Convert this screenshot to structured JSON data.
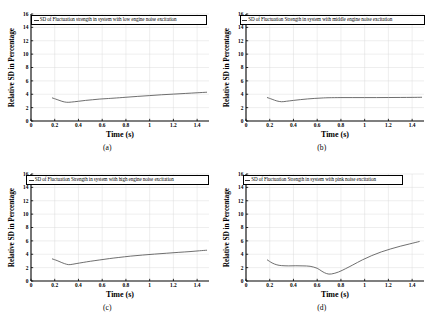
{
  "figure": {
    "panels": [
      {
        "caption": "(a)",
        "legend_label": "SD of Fluctuation strength in system with low engine noise excitation",
        "legend_left": 31,
        "legend_width": 176
      },
      {
        "caption": "(b)",
        "legend_label": "SD of Fluctuation Strength in system with middle engine noise excitation",
        "legend_left": 25,
        "legend_width": 185
      },
      {
        "caption": "(c)",
        "legend_label": "SD of Fluctuation Strength in system with high engine noise excitation",
        "legend_left": 26,
        "legend_width": 183
      },
      {
        "caption": "(d)",
        "legend_label": "SD of Fluctuation Strength in system with pink noise excitation",
        "legend_left": 28,
        "legend_width": 160
      }
    ]
  },
  "chart_data": [
    {
      "type": "line",
      "title": "",
      "panel": "(a)",
      "legend": [
        "SD of Fluctuation strength in system with low engine noise excitation"
      ],
      "legend_position": "top-inside",
      "grid": true,
      "xlabel": "Time (s)",
      "ylabel": "Relative SD in Percentage",
      "xlim": [
        0,
        1.5
      ],
      "ylim": [
        0,
        16
      ],
      "xticks": [
        0,
        0.2,
        0.4,
        0.6,
        0.8,
        1,
        1.2,
        1.4
      ],
      "xticklabels": [
        "0",
        "0.2",
        "0.4",
        "0.6",
        "0.8",
        "1",
        "1.2",
        "1.4"
      ],
      "yticks": [
        0,
        2,
        4,
        6,
        8,
        10,
        12,
        14,
        16
      ],
      "yticklabels": [
        "0",
        "2",
        "4",
        "6",
        "8",
        "10",
        "12",
        "14",
        "16"
      ],
      "series": [
        {
          "name": "SD of Fluctuation strength in system with low engine noise excitation",
          "color": "#555555",
          "x": [
            0.18,
            0.22,
            0.26,
            0.3,
            0.34,
            0.4,
            0.46,
            0.52,
            0.58,
            0.64,
            0.7,
            0.8,
            0.9,
            1.0,
            1.1,
            1.2,
            1.3,
            1.4,
            1.48
          ],
          "y": [
            3.45,
            3.2,
            2.95,
            2.8,
            2.83,
            2.95,
            3.08,
            3.18,
            3.28,
            3.35,
            3.42,
            3.55,
            3.68,
            3.8,
            3.92,
            4.02,
            4.12,
            4.22,
            4.3
          ]
        }
      ]
    },
    {
      "type": "line",
      "title": "",
      "panel": "(b)",
      "legend": [
        "SD of Fluctuation Strength in system with middle engine noise excitation"
      ],
      "legend_position": "top-inside",
      "grid": true,
      "xlabel": "Time (s)",
      "ylabel": "Relative SD in Percentage",
      "xlim": [
        0,
        1.5
      ],
      "ylim": [
        0,
        16
      ],
      "xticks": [
        0,
        0.2,
        0.4,
        0.6,
        0.8,
        1,
        1.2,
        1.4
      ],
      "xticklabels": [
        "0",
        "0.2",
        "0.4",
        "0.6",
        "0.8",
        "1",
        "1.2",
        "1.4"
      ],
      "yticks": [
        0,
        2,
        4,
        6,
        8,
        10,
        12,
        14,
        16
      ],
      "yticklabels": [
        "0",
        "2",
        "4",
        "6",
        "8",
        "10",
        "12",
        "14",
        "16"
      ],
      "series": [
        {
          "name": "SD of Fluctuation Strength in system with middle engine noise excitation",
          "color": "#555555",
          "x": [
            0.18,
            0.22,
            0.26,
            0.3,
            0.34,
            0.4,
            0.46,
            0.52,
            0.58,
            0.64,
            0.7,
            0.8,
            0.9,
            1.0,
            1.1,
            1.2,
            1.3,
            1.4,
            1.48
          ],
          "y": [
            3.5,
            3.25,
            3.0,
            2.88,
            2.95,
            3.08,
            3.2,
            3.3,
            3.38,
            3.44,
            3.48,
            3.5,
            3.5,
            3.5,
            3.5,
            3.51,
            3.52,
            3.53,
            3.55
          ]
        }
      ]
    },
    {
      "type": "line",
      "title": "",
      "panel": "(c)",
      "legend": [
        "SD of Fluctuation Strength in system with high engine noise excitation"
      ],
      "legend_position": "top-inside",
      "grid": true,
      "xlabel": "Time (s)",
      "ylabel": "Relative SD in Percentage",
      "xlim": [
        0,
        1.5
      ],
      "ylim": [
        0,
        16
      ],
      "xticks": [
        0,
        0.2,
        0.4,
        0.6,
        0.8,
        1,
        1.2,
        1.4
      ],
      "xticklabels": [
        "0",
        "0.2",
        "0.4",
        "0.6",
        "0.8",
        "1",
        "1.2",
        "1.4"
      ],
      "yticks": [
        0,
        2,
        4,
        6,
        8,
        10,
        12,
        14,
        16
      ],
      "yticklabels": [
        "0",
        "2",
        "4",
        "6",
        "8",
        "10",
        "12",
        "14",
        "16"
      ],
      "series": [
        {
          "name": "SD of Fluctuation Strength in system with high engine noise excitation",
          "color": "#555555",
          "x": [
            0.18,
            0.22,
            0.26,
            0.3,
            0.33,
            0.38,
            0.44,
            0.5,
            0.58,
            0.66,
            0.74,
            0.84,
            0.94,
            1.04,
            1.14,
            1.24,
            1.34,
            1.42,
            1.48
          ],
          "y": [
            3.3,
            3.05,
            2.75,
            2.5,
            2.45,
            2.6,
            2.78,
            2.95,
            3.15,
            3.35,
            3.52,
            3.72,
            3.88,
            4.02,
            4.15,
            4.28,
            4.4,
            4.52,
            4.6
          ]
        }
      ]
    },
    {
      "type": "line",
      "title": "",
      "panel": "(d)",
      "legend": [
        "SD of Fluctuation Strength in system with pink noise excitation"
      ],
      "legend_position": "top-inside",
      "grid": true,
      "xlabel": "Time (s)",
      "ylabel": "Relative SD in Percentage",
      "xlim": [
        0,
        1.5
      ],
      "ylim": [
        0,
        16
      ],
      "xticks": [
        0,
        0.2,
        0.4,
        0.6,
        0.8,
        1,
        1.2,
        1.4
      ],
      "xticklabels": [
        "0",
        "0.2",
        "0.4",
        "0.6",
        "0.8",
        "1",
        "1.2",
        "1.4"
      ],
      "yticks": [
        0,
        2,
        4,
        6,
        8,
        10,
        12,
        14,
        16
      ],
      "yticklabels": [
        "0",
        "2",
        "4",
        "6",
        "8",
        "10",
        "12",
        "14",
        "16"
      ],
      "series": [
        {
          "name": "SD of Fluctuation Strength in system with pink noise excitation",
          "color": "#555555",
          "x": [
            0.18,
            0.22,
            0.26,
            0.3,
            0.36,
            0.42,
            0.48,
            0.54,
            0.6,
            0.64,
            0.68,
            0.72,
            0.78,
            0.84,
            0.9,
            0.98,
            1.06,
            1.14,
            1.22,
            1.3,
            1.38,
            1.46
          ],
          "y": [
            3.15,
            2.7,
            2.42,
            2.3,
            2.26,
            2.28,
            2.26,
            2.2,
            1.9,
            1.45,
            1.1,
            1.05,
            1.35,
            1.85,
            2.4,
            3.15,
            3.8,
            4.35,
            4.8,
            5.2,
            5.55,
            5.9
          ]
        }
      ]
    }
  ]
}
